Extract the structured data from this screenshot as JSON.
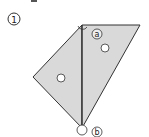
{
  "figure": {
    "step_label": "1",
    "angle_labels": [
      {
        "id": "a",
        "text": "a"
      },
      {
        "id": "b",
        "text": "b"
      }
    ],
    "colors": {
      "fill": "#d9d9d9",
      "stroke": "#333333",
      "dot": "#ffffff"
    }
  }
}
